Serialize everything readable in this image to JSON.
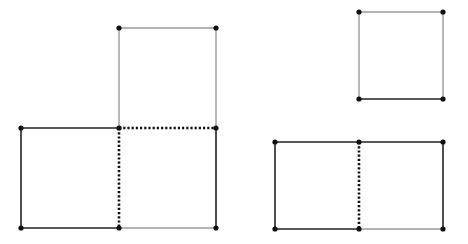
{
  "diagram": {
    "colors": {
      "dark": "#222222",
      "light": "#9a9a9a",
      "dot": "#111111",
      "background": "#ffffff"
    },
    "figures": [
      {
        "name": "l-shape-three-squares",
        "segments": [
          {
            "x1": 21,
            "y1": 128,
            "x2": 119,
            "y2": 128,
            "style": "dark"
          },
          {
            "x1": 21,
            "y1": 128,
            "x2": 21,
            "y2": 228,
            "style": "dark"
          },
          {
            "x1": 21,
            "y1": 228,
            "x2": 119,
            "y2": 228,
            "style": "dark"
          },
          {
            "x1": 119,
            "y1": 128,
            "x2": 119,
            "y2": 228,
            "style": "dotted"
          },
          {
            "x1": 119,
            "y1": 128,
            "x2": 216,
            "y2": 128,
            "style": "dotted"
          },
          {
            "x1": 119,
            "y1": 28,
            "x2": 216,
            "y2": 28,
            "style": "light"
          },
          {
            "x1": 119,
            "y1": 28,
            "x2": 119,
            "y2": 128,
            "style": "light"
          },
          {
            "x1": 216,
            "y1": 28,
            "x2": 216,
            "y2": 128,
            "style": "light"
          },
          {
            "x1": 216,
            "y1": 128,
            "x2": 216,
            "y2": 228,
            "style": "dark"
          },
          {
            "x1": 119,
            "y1": 228,
            "x2": 216,
            "y2": 228,
            "style": "light"
          }
        ],
        "points": [
          [
            21,
            128
          ],
          [
            119,
            128
          ],
          [
            216,
            128
          ],
          [
            119,
            28
          ],
          [
            216,
            28
          ],
          [
            21,
            228
          ],
          [
            119,
            228
          ],
          [
            216,
            228
          ]
        ]
      },
      {
        "name": "single-square",
        "segments": [
          {
            "x1": 359,
            "y1": 12,
            "x2": 443,
            "y2": 12,
            "style": "light"
          },
          {
            "x1": 359,
            "y1": 12,
            "x2": 359,
            "y2": 99,
            "style": "light"
          },
          {
            "x1": 443,
            "y1": 12,
            "x2": 443,
            "y2": 99,
            "style": "light"
          },
          {
            "x1": 359,
            "y1": 99,
            "x2": 443,
            "y2": 99,
            "style": "dark"
          }
        ],
        "points": [
          [
            359,
            12
          ],
          [
            443,
            12
          ],
          [
            359,
            99
          ],
          [
            443,
            99
          ]
        ]
      },
      {
        "name": "two-squares-rectangle",
        "segments": [
          {
            "x1": 275,
            "y1": 142,
            "x2": 359,
            "y2": 142,
            "style": "dark"
          },
          {
            "x1": 359,
            "y1": 142,
            "x2": 443,
            "y2": 142,
            "style": "dark"
          },
          {
            "x1": 275,
            "y1": 142,
            "x2": 275,
            "y2": 229,
            "style": "dark"
          },
          {
            "x1": 443,
            "y1": 142,
            "x2": 443,
            "y2": 229,
            "style": "dark"
          },
          {
            "x1": 275,
            "y1": 229,
            "x2": 359,
            "y2": 229,
            "style": "dark"
          },
          {
            "x1": 359,
            "y1": 229,
            "x2": 443,
            "y2": 229,
            "style": "light"
          },
          {
            "x1": 359,
            "y1": 142,
            "x2": 359,
            "y2": 229,
            "style": "dotted"
          }
        ],
        "points": [
          [
            275,
            142
          ],
          [
            359,
            142
          ],
          [
            443,
            142
          ],
          [
            275,
            229
          ],
          [
            359,
            229
          ],
          [
            443,
            229
          ]
        ]
      }
    ]
  }
}
